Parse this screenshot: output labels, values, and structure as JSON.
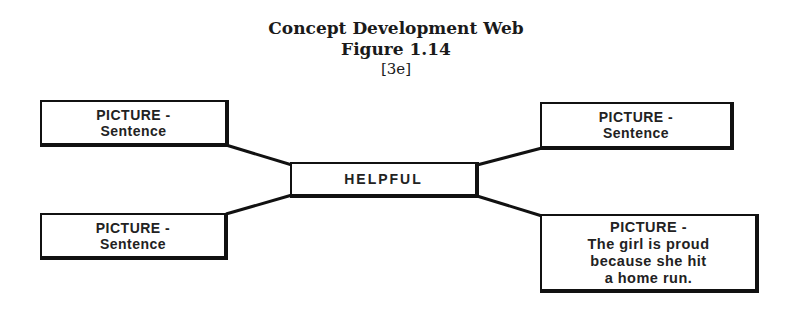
{
  "title": {
    "line1": "Concept Development Web",
    "line2": "Figure 1.14",
    "line3": "[3e]"
  },
  "center": {
    "label": "HELPFUL"
  },
  "nodes": {
    "top_left": {
      "line1": "PICTURE -",
      "line2": "Sentence"
    },
    "top_right": {
      "line1": "PICTURE -",
      "line2": "Sentence"
    },
    "bottom_left": {
      "line1": "PICTURE -",
      "line2": "Sentence"
    },
    "bottom_right": {
      "line1": "PICTURE -",
      "line2": "The girl is proud",
      "line3": "because she hit",
      "line4": "a home run."
    }
  }
}
